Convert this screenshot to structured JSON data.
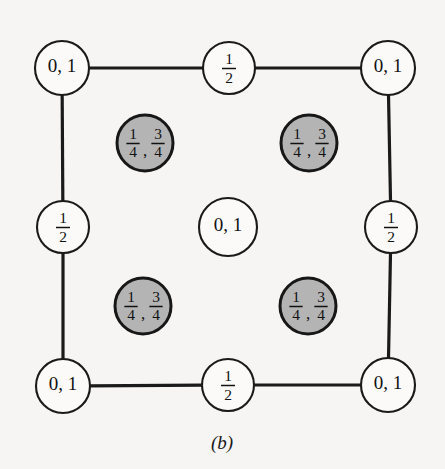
{
  "figure": {
    "caption": "(b)",
    "background_color": "#f7f5f3",
    "line_color": "#1a1a1a",
    "open_circle_fill": "#fbfaf8",
    "shaded_circle_fill": "#b4b4b4",
    "corner_label": "0, 1",
    "edge_label_numerator": "1",
    "edge_label_denominator": "2",
    "center_label": "0, 1",
    "interior_label_first_numerator": "1",
    "interior_label_first_denominator": "4",
    "interior_label_separator": ",",
    "interior_label_second_numerator": "3",
    "interior_label_second_denominator": "4"
  },
  "chart_data": {
    "type": "scatter",
    "title": "(b)",
    "xlabel": "",
    "ylabel": "",
    "xlim": [
      0,
      1
    ],
    "ylim": [
      0,
      1
    ],
    "grid": false,
    "legend": null,
    "annotations": [
      "Corner sites labeled 0, 1",
      "Edge midpoint sites labeled 1/2",
      "Cell-centre site labeled 0, 1",
      "Four interior shaded sites labeled 1/4 , 3/4"
    ],
    "points": [
      {
        "id": "corner-top-left",
        "x": 0.0,
        "y": 1.0,
        "px": 62,
        "py": 68,
        "r": 27,
        "shaded": false,
        "label": "0, 1",
        "label_type": "plain"
      },
      {
        "id": "edge-top-middle",
        "x": 0.5,
        "y": 1.0,
        "px": 229,
        "py": 68,
        "r": 26,
        "shaded": false,
        "label": "1/2",
        "label_type": "fraction"
      },
      {
        "id": "corner-top-right",
        "x": 1.0,
        "y": 1.0,
        "px": 388,
        "py": 68,
        "r": 27,
        "shaded": false,
        "label": "0, 1",
        "label_type": "plain"
      },
      {
        "id": "interior-upper-left",
        "x": 0.25,
        "y": 0.75,
        "px": 145,
        "py": 143,
        "r": 28,
        "shaded": true,
        "label": "1/4 , 3/4",
        "label_type": "double-fraction"
      },
      {
        "id": "interior-upper-right",
        "x": 0.75,
        "y": 0.75,
        "px": 309,
        "py": 143,
        "r": 28,
        "shaded": true,
        "label": "1/4 , 3/4",
        "label_type": "double-fraction"
      },
      {
        "id": "edge-middle-left",
        "x": 0.0,
        "y": 0.5,
        "px": 63,
        "py": 227,
        "r": 26,
        "shaded": false,
        "label": "1/2",
        "label_type": "fraction"
      },
      {
        "id": "center",
        "x": 0.5,
        "y": 0.5,
        "px": 228,
        "py": 227,
        "r": 29,
        "shaded": false,
        "label": "0, 1",
        "label_type": "plain"
      },
      {
        "id": "edge-middle-right",
        "x": 1.0,
        "y": 0.5,
        "px": 391,
        "py": 227,
        "r": 26,
        "shaded": false,
        "label": "1/2",
        "label_type": "fraction"
      },
      {
        "id": "interior-lower-left",
        "x": 0.25,
        "y": 0.25,
        "px": 143,
        "py": 306,
        "r": 28,
        "shaded": true,
        "label": "1/4 , 3/4",
        "label_type": "double-fraction"
      },
      {
        "id": "interior-lower-right",
        "x": 0.75,
        "y": 0.25,
        "px": 308,
        "py": 306,
        "r": 28,
        "shaded": true,
        "label": "1/4 , 3/4",
        "label_type": "double-fraction"
      },
      {
        "id": "corner-bottom-left",
        "x": 0.0,
        "y": 0.0,
        "px": 63,
        "py": 386,
        "r": 27,
        "shaded": false,
        "label": "0, 1",
        "label_type": "plain"
      },
      {
        "id": "edge-bottom-middle",
        "x": 0.5,
        "y": 0.0,
        "px": 228,
        "py": 385,
        "r": 26,
        "shaded": false,
        "label": "1/2",
        "label_type": "fraction"
      },
      {
        "id": "corner-bottom-right",
        "x": 1.0,
        "y": 0.0,
        "px": 388,
        "py": 385,
        "r": 27,
        "shaded": false,
        "label": "0, 1",
        "label_type": "plain"
      }
    ],
    "edges": [
      {
        "id": "bond-top-left-to-top-middle",
        "from": "corner-top-left",
        "to": "edge-top-middle"
      },
      {
        "id": "bond-top-middle-to-top-right",
        "from": "edge-top-middle",
        "to": "corner-top-right"
      },
      {
        "id": "bond-top-left-to-middle-left",
        "from": "corner-top-left",
        "to": "edge-middle-left"
      },
      {
        "id": "bond-middle-left-to-bottom-left",
        "from": "edge-middle-left",
        "to": "corner-bottom-left"
      },
      {
        "id": "bond-top-right-to-middle-right",
        "from": "corner-top-right",
        "to": "edge-middle-right"
      },
      {
        "id": "bond-middle-right-to-bot-right",
        "from": "edge-middle-right",
        "to": "corner-bottom-right"
      },
      {
        "id": "bond-bottom-left-to-bot-middle",
        "from": "corner-bottom-left",
        "to": "edge-bottom-middle"
      },
      {
        "id": "bond-bot-middle-to-bottom-right",
        "from": "edge-bottom-middle",
        "to": "corner-bottom-right"
      }
    ]
  }
}
